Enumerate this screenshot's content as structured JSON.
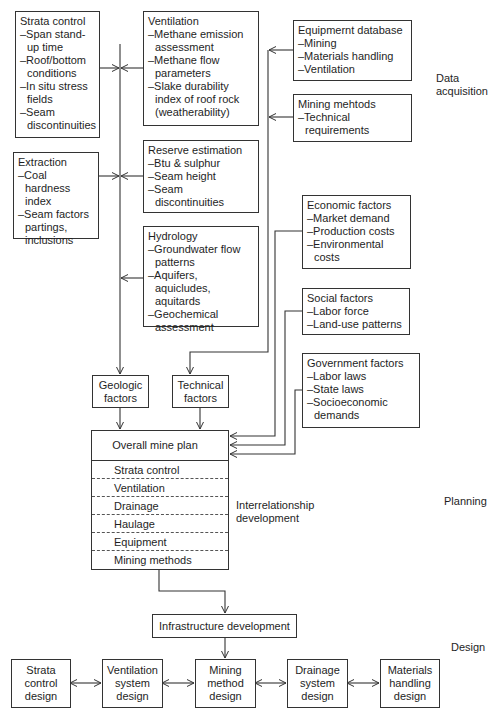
{
  "stages": {
    "data_acquisition": "Data\nacquisition",
    "planning": "Planning",
    "design": "Design"
  },
  "geologic_inputs": [
    {
      "title": "Strata control",
      "items": [
        "–Span stand-up time",
        "–Roof/bottom conditions",
        "–In situ stress fields",
        "–Seam discontinuities"
      ]
    },
    {
      "title": "Extraction",
      "items": [
        "–Coal hardness index",
        "–Seam factors partings, inclusions"
      ]
    }
  ],
  "middle_inputs": [
    {
      "title": "Ventilation",
      "items": [
        "–Methane emission assessment",
        "–Methane flow parameters",
        "–Slake durability index of roof rock (weatherability)"
      ]
    },
    {
      "title": "Reserve estimation",
      "items": [
        "–Btu & sulphur",
        "–Seam height",
        "–Seam discontinuities"
      ]
    },
    {
      "title": "Hydrology",
      "items": [
        "–Groundwater flow patterns",
        "–Aquifers, aquicludes, aquitards",
        "–Geochemical assessment"
      ]
    }
  ],
  "technical_inputs": [
    {
      "title": "Equipmernt database",
      "items": [
        "–Mining",
        "–Materials handling",
        "–Ventilation"
      ]
    },
    {
      "title": "Mining mehtods",
      "items": [
        "–Technical requirements"
      ]
    }
  ],
  "external_factors": [
    {
      "title": "Economic factors",
      "items": [
        "–Market demand",
        "–Production costs",
        "–Environmental costs"
      ]
    },
    {
      "title": "Social factors",
      "items": [
        "–Labor force",
        "–Land-use patterns"
      ]
    },
    {
      "title": "Government factors",
      "items": [
        "–Labor laws",
        "–State laws",
        "–Socioeconomic demands"
      ]
    }
  ],
  "aggregators": {
    "geologic": "Geologic factors",
    "technical": "Technical factors"
  },
  "plan": {
    "title": "Overall mine plan",
    "rows": [
      "Strata control",
      "Ventilation",
      "Drainage",
      "Haulage",
      "Equipment",
      "Mining methods"
    ],
    "interrelationship": "Interrelationship development"
  },
  "infrastructure": "Infrastructure development",
  "design_boxes": [
    "Strata control design",
    "Ventilation system design",
    "Mining method design",
    "Drainage system design",
    "Materials handling design"
  ]
}
